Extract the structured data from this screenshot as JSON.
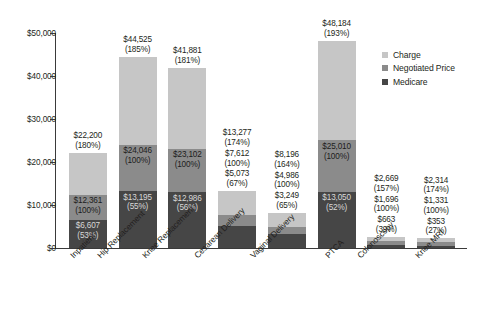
{
  "chart_data": {
    "type": "bar",
    "subtype": "stacked-overlay",
    "title": "",
    "xlabel": "",
    "ylabel": "",
    "ylim": [
      0,
      50000
    ],
    "grid": false,
    "legend_position": "top-right",
    "y_ticks": [
      "$0",
      "$10,000",
      "$20,000",
      "$30,000",
      "$40,000",
      "$50,000"
    ],
    "y_tick_values": [
      0,
      10000,
      20000,
      30000,
      40000,
      50000
    ],
    "categories": [
      "Inpatient",
      "Hip Replacement",
      "Knee Replacement",
      "Cesarean Delivery",
      "Vaginal Delivery",
      "PTCA",
      "Colonoscopy",
      "Knee MRI"
    ],
    "series": [
      {
        "name": "Charge",
        "color": "#c6c6c6",
        "values": [
          22200,
          44525,
          41881,
          13277,
          8196,
          48184,
          2669,
          2314
        ],
        "labels": [
          "$22,200",
          "$44,525",
          "$41,881",
          "$13,277",
          "$8,196",
          "$48,184",
          "$2,669",
          "$2,314"
        ],
        "percents": [
          "(180%)",
          "(185%)",
          "(181%)",
          "(174%)",
          "(164%)",
          "(193%)",
          "(157%)",
          "(174%)"
        ]
      },
      {
        "name": "Negotiated Price",
        "color": "#8b8b8b",
        "values": [
          12361,
          24046,
          23102,
          7612,
          4986,
          25010,
          1696,
          1331
        ],
        "labels": [
          "$12,361",
          "$24,046",
          "$23,102",
          "$7,612",
          "$4,986",
          "$25,010",
          "$1,696",
          "$1,331"
        ],
        "percents": [
          "(100%)",
          "(100%)",
          "(100%)",
          "(100%)",
          "(100%)",
          "(100%)",
          "(100%)",
          "(100%)"
        ]
      },
      {
        "name": "Medicare",
        "color": "#464646",
        "values": [
          6607,
          13195,
          12986,
          5073,
          3249,
          13050,
          663,
          353
        ],
        "labels": [
          "$6,607",
          "$13,195",
          "$12,986",
          "$5,073",
          "$3,249",
          "$13,050",
          "$663",
          "$353"
        ],
        "percents": [
          "(53%)",
          "(55%)",
          "(56%)",
          "(67%)",
          "(65%)",
          "(52%)",
          "(39%)",
          "(27%)"
        ]
      }
    ]
  },
  "legend": {
    "items": [
      {
        "label": "Charge",
        "color": "#c6c6c6"
      },
      {
        "label": "Negotiated Price",
        "color": "#8b8b8b"
      },
      {
        "label": "Medicare",
        "color": "#464646"
      }
    ]
  }
}
